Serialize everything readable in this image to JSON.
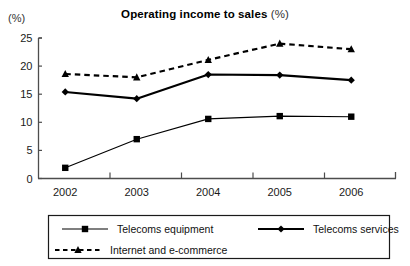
{
  "chart_data": {
    "type": "line",
    "title": "Operating income to sales (%)",
    "title_main": "Operating income to sales",
    "title_suffix": "(%)",
    "ylabel": "(%)",
    "xlabel": "",
    "categories": [
      "2002",
      "2003",
      "2004",
      "2005",
      "2006"
    ],
    "yticks": [
      0,
      5,
      10,
      15,
      20,
      25
    ],
    "ylim": [
      0,
      25
    ],
    "grid": false,
    "legend_position": "bottom",
    "series": [
      {
        "name": "Telecoms equipment",
        "marker": "square",
        "line_style": "solid",
        "line_width": "thin",
        "color": "#000000",
        "values": [
          1.9,
          7.0,
          10.6,
          11.1,
          11.0
        ]
      },
      {
        "name": "Telecoms  services",
        "marker": "diamond",
        "line_style": "solid",
        "line_width": "thick",
        "color": "#000000",
        "values": [
          15.4,
          14.2,
          18.5,
          18.4,
          17.5
        ]
      },
      {
        "name": "Internet and e-commerce",
        "marker": "triangle",
        "line_style": "dashed",
        "line_width": "thick",
        "color": "#000000",
        "values": [
          18.6,
          18.0,
          21.1,
          24.0,
          23.0
        ]
      }
    ]
  },
  "legend": {
    "items": [
      {
        "label": "Telecoms equipment"
      },
      {
        "label": "Telecoms  services"
      },
      {
        "label": "Internet and e-commerce"
      }
    ]
  },
  "colors": {
    "ink": "#000000",
    "axis": "#4d4d4d",
    "background": "#ffffff"
  }
}
